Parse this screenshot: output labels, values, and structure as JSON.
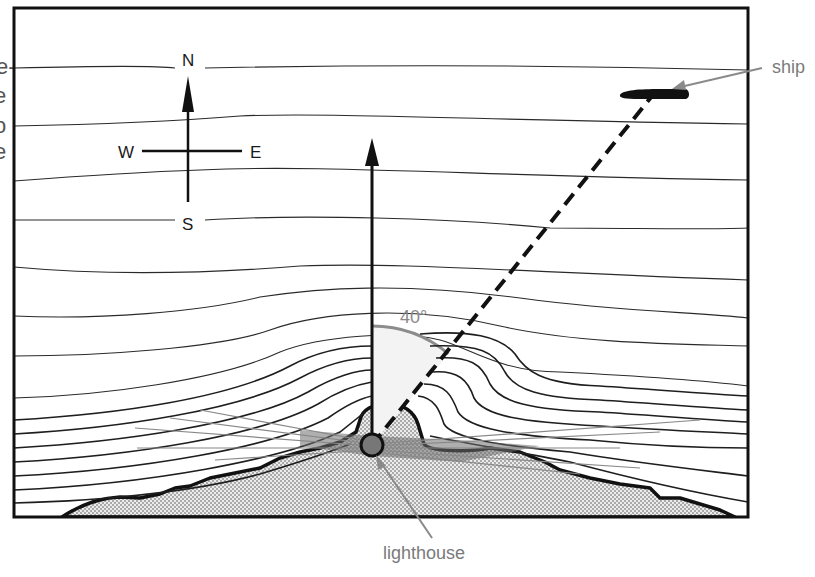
{
  "figure": {
    "edge_text_fragments": [
      "e-",
      "e",
      "o",
      "e"
    ],
    "compass": {
      "north": "N",
      "south": "S",
      "east": "E",
      "west": "W"
    },
    "angle_label": "40°",
    "labels": {
      "ship": "ship",
      "lighthouse": "lighthouse"
    },
    "icons": {
      "compass": "compass-rose-icon",
      "north_arrow": "arrow-up-icon",
      "ship": "ship-silhouette-icon",
      "lighthouse": "circle-icon"
    },
    "colors": {
      "ink": "#1a1a1a",
      "label_gray": "#7a7a7a",
      "land_fill": "#d9d9d9",
      "light_beam": "#6e6e6e",
      "angle_arc": "#8c8c8c",
      "angle_sector": "#f2f2f2",
      "lighthouse_fill": "#777777"
    }
  }
}
